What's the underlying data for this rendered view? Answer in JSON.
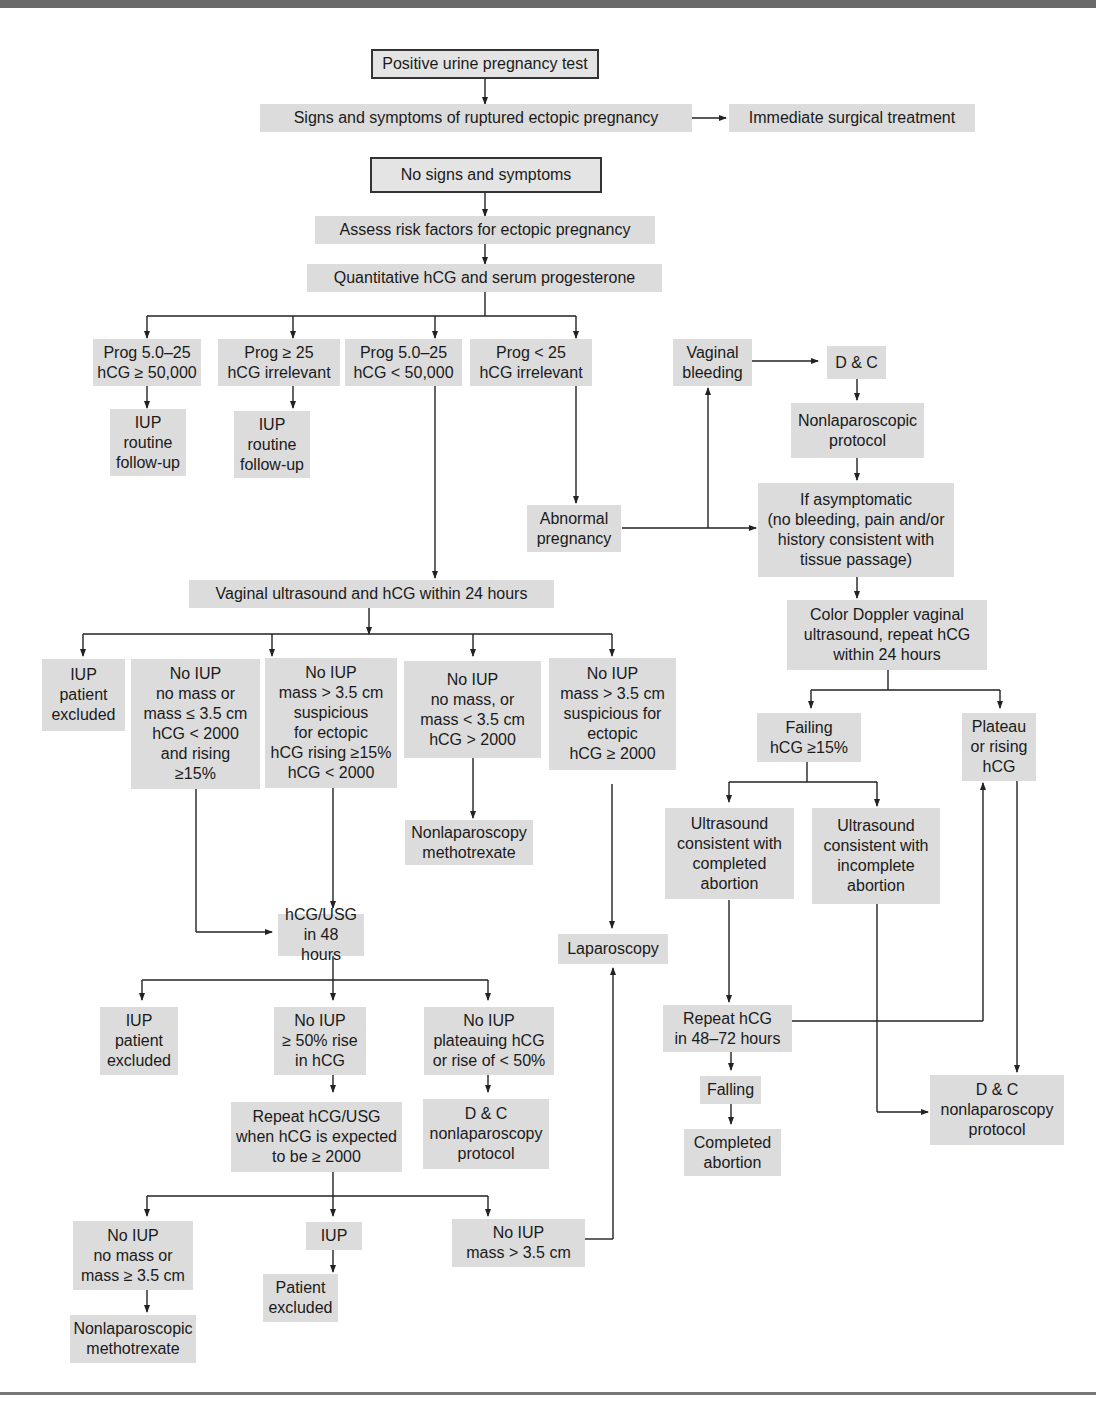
{
  "diagram": {
    "colors": {
      "box_fill": "#dcdcdc",
      "line": "#222222",
      "rule": "#6a6a6a"
    },
    "nodes": {
      "positive_test": "Positive urine pregnancy test",
      "ruptured_signs": "Signs and symptoms of ruptured ectopic pregnancy",
      "immediate_surgery": "Immediate surgical treatment",
      "no_signs": "No signs and symptoms",
      "assess_risk": "Assess risk factors for ectopic pregnancy",
      "quant_hcg": "Quantitative hCG and serum progesterone",
      "prog_a": "Prog 5.0–25\nhCG ≥ 50,000",
      "prog_b": "Prog ≥ 25\nhCG irrelevant",
      "prog_c": "Prog 5.0–25\nhCG < 50,000",
      "prog_d": "Prog < 25\nhCG irrelevant",
      "iup_followup_a": "IUP\nroutine\nfollow-up",
      "iup_followup_b": "IUP\nroutine\nfollow-up",
      "vaginal_bleeding": "Vaginal\nbleeding",
      "dc_top": "D & C",
      "nonlap_protocol": "Nonlaparoscopic\nprotocol",
      "abnormal_pregnancy": "Abnormal\npregnancy",
      "if_asymptomatic": "If asymptomatic\n(no bleeding, pain and/or\nhistory consistent with\ntissue passage)",
      "vaginal_us_24": "Vaginal ultrasound and hCG within 24 hours",
      "us_iup_excluded": "IUP\npatient\nexcluded",
      "us_no_iup_rising": "No IUP\nno mass or\nmass ≤ 3.5 cm\nhCG < 2000\nand rising\n≥15%",
      "us_no_iup_suspicious": "No IUP\nmass > 3.5 cm\nsuspicious\nfor ectopic\nhCG rising ≥15%\nhCG < 2000",
      "us_no_iup_gt2000": "No IUP\nno mass, or\nmass < 3.5 cm\nhCG > 2000",
      "us_no_iup_ectopic": "No IUP\nmass > 3.5 cm\nsuspicious for\nectopic\nhCG ≥ 2000",
      "nonlap_methotrexate_mid": "Nonlaparoscopy\nmethotrexate",
      "hcg_usg_48": "hCG/USG\nin 48 hours",
      "laparoscopy": "Laparoscopy",
      "h48_iup_excluded": "IUP\npatient\nexcluded",
      "h48_no_iup_rise": "No IUP\n≥ 50% rise\nin hCG",
      "h48_no_iup_plateau": "No IUP\nplateauing hCG\nor rise of < 50%",
      "repeat_hcg_usg": "Repeat hCG/USG\nwhen hCG is expected\nto be ≥ 2000",
      "dc_nonlap_left": "D & C\nnonlaparoscopy\nprotocol",
      "final_no_iup_mass": "No IUP\nno mass or\nmass ≥ 3.5 cm",
      "final_iup": "IUP",
      "final_no_iup_gt35": "No IUP\nmass > 3.5 cm",
      "nonlap_methotrexate_bottom": "Nonlaparoscopic\nmethotrexate",
      "patient_excluded": "Patient\nexcluded",
      "color_doppler": "Color Doppler vaginal\nultrasound, repeat hCG\nwithin 24 hours",
      "failing_hcg": "Failing\nhCG ≥15%",
      "plateau_rising": "Plateau\nor rising\nhCG",
      "us_completed": "Ultrasound\nconsistent with\ncompleted\nabortion",
      "us_incomplete": "Ultrasound\nconsistent with\nincomplete\nabortion",
      "repeat_hcg_4872": "Repeat hCG\nin 48–72 hours",
      "falling": "Falling",
      "completed_abortion": "Completed\nabortion",
      "dc_nonlap_right": "D & C\nnonlaparoscopy\nprotocol"
    }
  }
}
